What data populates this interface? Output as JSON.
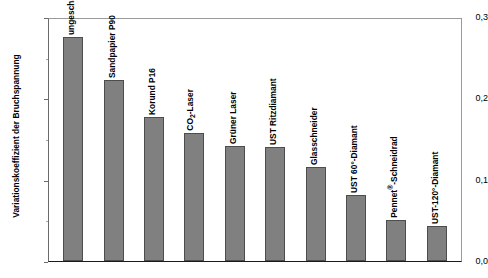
{
  "chart_data": {
    "type": "bar",
    "title": "",
    "xlabel": "",
    "ylabel": "Variationskoeffizient der Bruchspannung",
    "ylim": [
      0.0,
      0.3
    ],
    "yticks": [
      "0,0",
      "0,1",
      "0,2",
      "0,3"
    ],
    "ytick_values": [
      0.0,
      0.1,
      0.2,
      0.3
    ],
    "minor_tick_values": [
      0.05,
      0.15,
      0.25
    ],
    "grid": false,
    "legend": "none",
    "bar_color": "#808080",
    "bar_edge_color": "#4d4d4d",
    "categories": [
      "ungeschädigt",
      "Sandpapier P90",
      "Korund P16",
      "CO2-Laser",
      "Grüner Laser",
      "UST Ritzdiamant",
      "Glasschneider",
      "UST 60°-Diamant",
      "Pennet®-Schneidrad",
      "UST-120°-Diamant"
    ],
    "values": [
      0.275,
      0.222,
      0.177,
      0.158,
      0.141,
      0.14,
      0.116,
      0.081,
      0.051,
      0.043
    ],
    "bars": [
      {
        "label_html": "ungeschädigt",
        "value": 0.275
      },
      {
        "label_html": "Sandpapier P90",
        "value": 0.222
      },
      {
        "label_html": "Korund P16",
        "value": 0.177
      },
      {
        "label_html": "CO<sub>2</sub>-Laser",
        "value": 0.158
      },
      {
        "label_html": "Grüner Laser",
        "value": 0.141
      },
      {
        "label_html": "UST Ritzdiamant",
        "value": 0.14
      },
      {
        "label_html": "Glasschneider",
        "value": 0.116
      },
      {
        "label_html": "UST 60°-Diamant",
        "value": 0.081
      },
      {
        "label_html": "Pennet<sup>®</sup>-Schneidrad",
        "value": 0.051
      },
      {
        "label_html": "UST-120°-Diamant",
        "value": 0.043
      }
    ]
  }
}
